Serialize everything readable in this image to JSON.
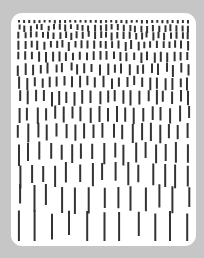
{
  "artwork": {
    "background_color": "#c6c6c6",
    "card_color": "#ffffff",
    "stroke_color": "#333333",
    "stroke_width": 2,
    "rows": [
      {
        "y": 7,
        "len": 3,
        "count": 34,
        "jitter": 0
      },
      {
        "y": 12,
        "len": 6,
        "count": 30,
        "jitter": 2
      },
      {
        "y": 19,
        "len": 7,
        "count": 30,
        "jitter": 2
      },
      {
        "y": 28,
        "len": 8,
        "count": 28,
        "jitter": 2
      },
      {
        "y": 39,
        "len": 9,
        "count": 26,
        "jitter": 2
      },
      {
        "y": 51,
        "len": 10,
        "count": 24,
        "jitter": 3
      },
      {
        "y": 64,
        "len": 11,
        "count": 23,
        "jitter": 3
      },
      {
        "y": 78,
        "len": 13,
        "count": 22,
        "jitter": 3
      },
      {
        "y": 94,
        "len": 14,
        "count": 20,
        "jitter": 3
      },
      {
        "y": 111,
        "len": 16,
        "count": 19,
        "jitter": 3
      },
      {
        "y": 130,
        "len": 18,
        "count": 17,
        "jitter": 4
      },
      {
        "y": 151,
        "len": 20,
        "count": 15,
        "jitter": 4
      },
      {
        "y": 173,
        "len": 24,
        "count": 13,
        "jitter": 4
      },
      {
        "y": 199,
        "len": 30,
        "count": 11,
        "jitter": 4
      }
    ]
  }
}
